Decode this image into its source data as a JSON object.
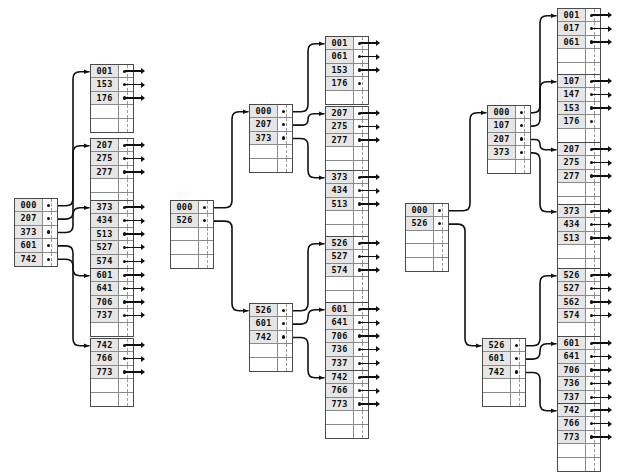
{
  "diagram": {
    "type": "b-plus-tree",
    "colors": {
      "node_border": "#4a4a4a",
      "cell_rule": "#8a8a8a",
      "key_fill": "#e6e6e6",
      "empty_fill": "#ffffff",
      "wire": "#111111",
      "background": "#ffffff"
    },
    "node_capacity": 5,
    "trees": [
      {
        "id": "tree-1",
        "name": "tree-left",
        "nodes": [
          {
            "id": "t1-root",
            "kind": "inner",
            "x": 14,
            "y": 198,
            "slots": 5,
            "keys": [
              "000",
              "207",
              "373",
              "601",
              "742"
            ]
          },
          {
            "id": "t1-leaf-001",
            "kind": "leaf",
            "x": 90,
            "y": 64,
            "slots": 5,
            "keys": [
              "001",
              "153",
              "176"
            ]
          },
          {
            "id": "t1-leaf-207",
            "kind": "leaf",
            "x": 90,
            "y": 138,
            "slots": 5,
            "keys": [
              "207",
              "275",
              "277"
            ]
          },
          {
            "id": "t1-leaf-373",
            "kind": "leaf",
            "x": 90,
            "y": 200,
            "slots": 5,
            "keys": [
              "373",
              "434",
              "513",
              "527",
              "574"
            ]
          },
          {
            "id": "t1-leaf-601",
            "kind": "leaf",
            "x": 90,
            "y": 268,
            "slots": 5,
            "keys": [
              "601",
              "641",
              "706",
              "737"
            ]
          },
          {
            "id": "t1-leaf-742",
            "kind": "leaf",
            "x": 90,
            "y": 338,
            "slots": 5,
            "keys": [
              "742",
              "766",
              "773"
            ]
          }
        ],
        "edges": [
          {
            "from": "t1-root",
            "slot": 0,
            "to": "t1-leaf-001"
          },
          {
            "from": "t1-root",
            "slot": 1,
            "to": "t1-leaf-207"
          },
          {
            "from": "t1-root",
            "slot": 2,
            "to": "t1-leaf-373"
          },
          {
            "from": "t1-root",
            "slot": 3,
            "to": "t1-leaf-601"
          },
          {
            "from": "t1-root",
            "slot": 4,
            "to": "t1-leaf-742"
          }
        ]
      },
      {
        "id": "tree-2",
        "name": "tree-middle",
        "nodes": [
          {
            "id": "t2-root",
            "kind": "inner",
            "x": 170,
            "y": 200,
            "slots": 5,
            "keys": [
              "000",
              "526"
            ]
          },
          {
            "id": "t2-inner-a",
            "kind": "inner",
            "x": 249,
            "y": 104,
            "slots": 5,
            "keys": [
              "000",
              "207",
              "373"
            ]
          },
          {
            "id": "t2-inner-b",
            "kind": "inner",
            "x": 249,
            "y": 303,
            "slots": 5,
            "keys": [
              "526",
              "601",
              "742"
            ]
          },
          {
            "id": "t2-leaf-001",
            "kind": "leaf",
            "x": 325,
            "y": 36,
            "slots": 5,
            "keys": [
              "001",
              "061",
              "153",
              "176"
            ],
            "record_arrows": [
              true,
              true,
              true,
              false
            ]
          },
          {
            "id": "t2-leaf-207",
            "kind": "leaf",
            "x": 325,
            "y": 106,
            "slots": 5,
            "keys": [
              "207",
              "275",
              "277"
            ]
          },
          {
            "id": "t2-leaf-373",
            "kind": "leaf",
            "x": 325,
            "y": 170,
            "slots": 5,
            "keys": [
              "373",
              "434",
              "513"
            ]
          },
          {
            "id": "t2-leaf-526",
            "kind": "leaf",
            "x": 325,
            "y": 236,
            "slots": 5,
            "keys": [
              "526",
              "527",
              "574"
            ]
          },
          {
            "id": "t2-leaf-601",
            "kind": "leaf",
            "x": 325,
            "y": 302,
            "slots": 5,
            "keys": [
              "601",
              "641",
              "706",
              "736",
              "737"
            ]
          },
          {
            "id": "t2-leaf-742",
            "kind": "leaf",
            "x": 325,
            "y": 370,
            "slots": 5,
            "keys": [
              "742",
              "766",
              "773"
            ]
          }
        ],
        "edges": [
          {
            "from": "t2-root",
            "slot": 0,
            "to": "t2-inner-a"
          },
          {
            "from": "t2-root",
            "slot": 1,
            "to": "t2-inner-b"
          },
          {
            "from": "t2-inner-a",
            "slot": 0,
            "to": "t2-leaf-001"
          },
          {
            "from": "t2-inner-a",
            "slot": 1,
            "to": "t2-leaf-207"
          },
          {
            "from": "t2-inner-a",
            "slot": 2,
            "to": "t2-leaf-373"
          },
          {
            "from": "t2-inner-b",
            "slot": 0,
            "to": "t2-leaf-526"
          },
          {
            "from": "t2-inner-b",
            "slot": 1,
            "to": "t2-leaf-601"
          },
          {
            "from": "t2-inner-b",
            "slot": 2,
            "to": "t2-leaf-742"
          }
        ]
      },
      {
        "id": "tree-3",
        "name": "tree-right",
        "nodes": [
          {
            "id": "t3-root",
            "kind": "inner",
            "x": 405,
            "y": 203,
            "slots": 5,
            "keys": [
              "000",
              "526"
            ]
          },
          {
            "id": "t3-inner-a",
            "kind": "inner",
            "x": 487,
            "y": 105,
            "slots": 5,
            "keys": [
              "000",
              "107",
              "207",
              "373"
            ]
          },
          {
            "id": "t3-inner-b",
            "kind": "inner",
            "x": 482,
            "y": 338,
            "slots": 5,
            "keys": [
              "526",
              "601",
              "742"
            ]
          },
          {
            "id": "t3-leaf-001",
            "kind": "leaf",
            "x": 557,
            "y": 8,
            "slots": 5,
            "keys": [
              "001",
              "017",
              "061"
            ]
          },
          {
            "id": "t3-leaf-107",
            "kind": "leaf",
            "x": 557,
            "y": 74,
            "slots": 5,
            "keys": [
              "107",
              "147",
              "153",
              "176"
            ],
            "record_arrows": [
              true,
              true,
              true,
              false
            ]
          },
          {
            "id": "t3-leaf-207",
            "kind": "leaf",
            "x": 557,
            "y": 142,
            "slots": 5,
            "keys": [
              "207",
              "275",
              "277"
            ]
          },
          {
            "id": "t3-leaf-373",
            "kind": "leaf",
            "x": 557,
            "y": 204,
            "slots": 5,
            "keys": [
              "373",
              "434",
              "513"
            ]
          },
          {
            "id": "t3-leaf-526",
            "kind": "leaf",
            "x": 557,
            "y": 268,
            "slots": 5,
            "keys": [
              "526",
              "527",
              "562",
              "574"
            ]
          },
          {
            "id": "t3-leaf-601",
            "kind": "leaf",
            "x": 557,
            "y": 336,
            "slots": 5,
            "keys": [
              "601",
              "641",
              "706",
              "736",
              "737"
            ]
          },
          {
            "id": "t3-leaf-742",
            "kind": "leaf",
            "x": 557,
            "y": 403,
            "slots": 5,
            "keys": [
              "742",
              "766",
              "773"
            ]
          }
        ],
        "edges": [
          {
            "from": "t3-root",
            "slot": 0,
            "to": "t3-inner-a"
          },
          {
            "from": "t3-root",
            "slot": 1,
            "to": "t3-inner-b"
          },
          {
            "from": "t3-inner-a",
            "slot": 0,
            "to": "t3-leaf-001"
          },
          {
            "from": "t3-inner-a",
            "slot": 1,
            "to": "t3-leaf-107"
          },
          {
            "from": "t3-inner-a",
            "slot": 2,
            "to": "t3-leaf-207"
          },
          {
            "from": "t3-inner-a",
            "slot": 3,
            "to": "t3-leaf-373"
          },
          {
            "from": "t3-inner-b",
            "slot": 0,
            "to": "t3-leaf-526"
          },
          {
            "from": "t3-inner-b",
            "slot": 1,
            "to": "t3-leaf-601"
          },
          {
            "from": "t3-inner-b",
            "slot": 2,
            "to": "t3-leaf-742"
          }
        ]
      }
    ]
  }
}
